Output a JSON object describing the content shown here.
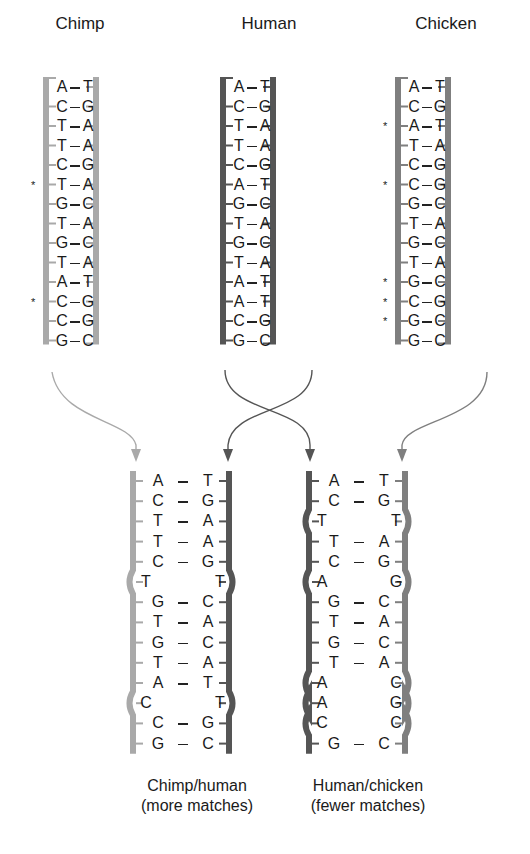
{
  "colors": {
    "chimp": "#a9a9a9",
    "human": "#555555",
    "chicken": "#7f7f7f",
    "text": "#1a1a1a"
  },
  "top_ladders": [
    {
      "id": "chimp",
      "title": "Chimp",
      "x": 45,
      "color_key": "chimp",
      "pairs": [
        [
          "A",
          "T",
          false
        ],
        [
          "C",
          "G",
          false
        ],
        [
          "T",
          "A",
          false
        ],
        [
          "T",
          "A",
          false
        ],
        [
          "C",
          "G",
          false
        ],
        [
          "T",
          "A",
          true
        ],
        [
          "G",
          "C",
          false
        ],
        [
          "T",
          "A",
          false
        ],
        [
          "G",
          "C",
          false
        ],
        [
          "T",
          "A",
          false
        ],
        [
          "A",
          "T",
          false
        ],
        [
          "C",
          "G",
          true
        ],
        [
          "C",
          "G",
          false
        ],
        [
          "G",
          "C",
          false
        ]
      ]
    },
    {
      "id": "human",
      "title": "Human",
      "x": 222,
      "color_key": "human",
      "pairs": [
        [
          "A",
          "T",
          false
        ],
        [
          "C",
          "G",
          false
        ],
        [
          "T",
          "A",
          false
        ],
        [
          "T",
          "A",
          false
        ],
        [
          "C",
          "G",
          false
        ],
        [
          "A",
          "T",
          false
        ],
        [
          "G",
          "C",
          false
        ],
        [
          "T",
          "A",
          false
        ],
        [
          "G",
          "C",
          false
        ],
        [
          "T",
          "A",
          false
        ],
        [
          "A",
          "T",
          false
        ],
        [
          "A",
          "T",
          false
        ],
        [
          "C",
          "G",
          false
        ],
        [
          "G",
          "C",
          false
        ]
      ]
    },
    {
      "id": "chicken",
      "title": "Chicken",
      "x": 397,
      "color_key": "chicken",
      "pairs": [
        [
          "A",
          "T",
          false
        ],
        [
          "C",
          "G",
          false
        ],
        [
          "A",
          "T",
          true
        ],
        [
          "T",
          "A",
          false
        ],
        [
          "C",
          "G",
          false
        ],
        [
          "C",
          "G",
          true
        ],
        [
          "G",
          "C",
          false
        ],
        [
          "T",
          "A",
          false
        ],
        [
          "G",
          "C",
          false
        ],
        [
          "T",
          "A",
          false
        ],
        [
          "G",
          "C",
          true
        ],
        [
          "C",
          "G",
          true
        ],
        [
          "G",
          "C",
          true
        ],
        [
          "G",
          "C",
          false
        ]
      ]
    }
  ],
  "bottom_hybrids": [
    {
      "id": "chimp-human",
      "x": 133,
      "left_color_key": "chimp",
      "right_color_key": "human",
      "caption_line1": "Chimp/human",
      "caption_line2": "(more matches)",
      "pairs": [
        [
          "A",
          "T",
          true
        ],
        [
          "C",
          "G",
          true
        ],
        [
          "T",
          "A",
          true
        ],
        [
          "T",
          "A",
          true
        ],
        [
          "C",
          "G",
          true
        ],
        [
          "T",
          "T",
          false
        ],
        [
          "G",
          "C",
          true
        ],
        [
          "T",
          "A",
          true
        ],
        [
          "G",
          "C",
          true
        ],
        [
          "T",
          "A",
          true
        ],
        [
          "A",
          "T",
          true
        ],
        [
          "C",
          "T",
          false
        ],
        [
          "C",
          "G",
          true
        ],
        [
          "G",
          "C",
          true
        ]
      ]
    },
    {
      "id": "human-chicken",
      "x": 309,
      "left_color_key": "human",
      "right_color_key": "chicken",
      "caption_line1": "Human/chicken",
      "caption_line2": "(fewer matches)",
      "pairs": [
        [
          "A",
          "T",
          true
        ],
        [
          "C",
          "G",
          true
        ],
        [
          "T",
          "T",
          false
        ],
        [
          "T",
          "A",
          true
        ],
        [
          "C",
          "G",
          true
        ],
        [
          "A",
          "G",
          false
        ],
        [
          "G",
          "C",
          true
        ],
        [
          "T",
          "A",
          true
        ],
        [
          "G",
          "C",
          true
        ],
        [
          "T",
          "A",
          true
        ],
        [
          "A",
          "C",
          false
        ],
        [
          "A",
          "G",
          false
        ],
        [
          "C",
          "C",
          false
        ],
        [
          "G",
          "C",
          true
        ]
      ]
    }
  ],
  "arrows": [
    {
      "from": "chimp",
      "to": "chimp-human-left",
      "color_key": "chimp"
    },
    {
      "from": "human",
      "to": "chimp-human-right",
      "color_key": "human"
    },
    {
      "from": "human",
      "to": "human-chicken-left",
      "color_key": "human"
    },
    {
      "from": "chicken",
      "to": "human-chicken-right",
      "color_key": "chicken"
    }
  ],
  "mismatch_marker": "*"
}
